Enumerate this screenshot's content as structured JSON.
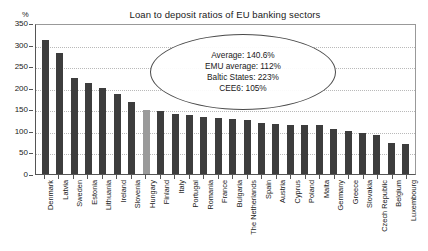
{
  "chart_data": {
    "type": "bar",
    "title": "Loan to deposit ratios of EU banking sectors",
    "xlabel": "",
    "ylabel": "%",
    "ylim": [
      0,
      350
    ],
    "ytick_step": 50,
    "yticks": [
      0,
      50,
      100,
      150,
      200,
      250,
      300,
      350
    ],
    "grid": true,
    "legend": "none",
    "categories": [
      "Denmark",
      "Latvia",
      "Sweden",
      "Estonia",
      "Lithuania",
      "Ireland",
      "Slovenia",
      "Hungary",
      "Finland",
      "Italy",
      "Portugal",
      "Romania",
      "France",
      "Bulgaria",
      "The Netherlands",
      "Spain",
      "Austria",
      "Cyprus",
      "Poland",
      "Malta",
      "Germany",
      "Greece",
      "Slovakia",
      "Czech Republic",
      "Belgium",
      "Luxembourg"
    ],
    "values": [
      310,
      280,
      222,
      211,
      200,
      185,
      168,
      148,
      145,
      140,
      137,
      133,
      130,
      128,
      125,
      118,
      115,
      113,
      113,
      113,
      104,
      100,
      95,
      90,
      72,
      70
    ],
    "highlight_category": "Hungary",
    "bar_color": "#3d3d3d",
    "highlight_color": "#9a9a9a",
    "annotation": {
      "lines": [
        "Average: 140.6%",
        "EMU average: 112%",
        "Baltic States: 223%",
        "CEE6: 105%"
      ],
      "average": "140.6%",
      "emu_average": "112%",
      "baltic_states": "223%",
      "cee6": "105%",
      "shape": "ellipse"
    }
  }
}
